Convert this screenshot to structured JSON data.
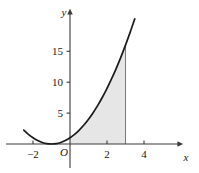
{
  "figure": {
    "background_color": "#ffffff",
    "axis_color": "#3a3a3a",
    "curve_color": "#1a1a1a",
    "shade_color": "#e6e6e6",
    "shade_edge_color": "#7a7a7a"
  },
  "labels": {
    "x_axis": "x",
    "y_axis": "y",
    "origin": "O"
  },
  "ticks": {
    "x": [
      {
        "value": -2,
        "label": "−2"
      },
      {
        "value": 2,
        "label": "2"
      },
      {
        "value": 4,
        "label": "4"
      }
    ],
    "y": [
      {
        "value": 5,
        "label": "5"
      },
      {
        "value": 10,
        "label": "10"
      },
      {
        "value": 15,
        "label": "15"
      }
    ]
  },
  "chart_data": {
    "type": "line",
    "title": "",
    "xlabel": "x",
    "ylabel": "y",
    "grid": false,
    "legend": null,
    "xlim": [
      -2.7,
      4.9
    ],
    "ylim": [
      -1.5,
      17.5
    ],
    "xticks": [
      -2,
      2,
      4
    ],
    "xticklabels": [
      "−2",
      "2",
      "4"
    ],
    "yticks": [
      5,
      10,
      15
    ],
    "yticklabels": [
      "5",
      "10",
      "15"
    ],
    "series": [
      {
        "name": "y = (x + 1)^2",
        "equation": "(x+1)^2",
        "x": [
          -2.5,
          -2.25,
          -2.0,
          -1.75,
          -1.5,
          -1.25,
          -1.0,
          -0.75,
          -0.5,
          -0.25,
          0.0,
          0.25,
          0.5,
          0.75,
          1.0,
          1.25,
          1.5,
          1.75,
          2.0,
          2.25,
          2.5,
          2.75,
          3.0,
          3.25,
          3.5
        ],
        "y": [
          2.25,
          1.5625,
          1.0,
          0.5625,
          0.25,
          0.0625,
          0.0,
          0.0625,
          0.25,
          0.5625,
          1.0,
          1.5625,
          2.25,
          3.0625,
          4.0,
          5.0625,
          6.25,
          7.5625,
          9.0,
          10.5625,
          12.25,
          14.0625,
          16.0,
          18.0625,
          20.25
        ]
      }
    ],
    "shaded_region": {
      "description": "Area under the curve between x = 0 and x = 3",
      "x_start": 0,
      "x_end": 3,
      "y_baseline": 0,
      "fill": "#e6e6e6"
    },
    "annotations": [
      {
        "text": "O",
        "x": 0,
        "y": 0,
        "role": "origin-label"
      }
    ]
  }
}
